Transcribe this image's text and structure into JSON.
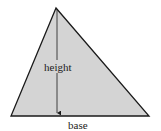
{
  "diagram": {
    "type": "triangle-area",
    "labels": {
      "height": "height",
      "base": "base"
    },
    "colors": {
      "fill": "#d4d4d4",
      "stroke": "#1a1a1a",
      "background": "#ffffff"
    }
  }
}
